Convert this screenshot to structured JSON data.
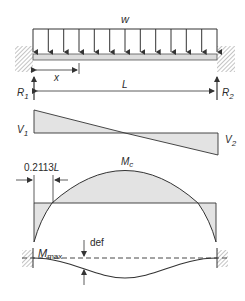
{
  "diagram": {
    "load": {
      "label": "w",
      "arrow_count": 13
    },
    "dimensions": {
      "x_label": "x",
      "span_label": "L",
      "inflection_label_prefix": "0.2113",
      "inflection_label_suffix": "L"
    },
    "reactions": {
      "left": {
        "main": "R",
        "sub": "1"
      },
      "right": {
        "main": "R",
        "sub": "2"
      }
    },
    "shear": {
      "left": {
        "main": "V",
        "sub": "1"
      },
      "right": {
        "main": "V",
        "sub": "2"
      }
    },
    "moment": {
      "center": {
        "main": "M",
        "sub": "c"
      },
      "end": {
        "main": "M",
        "sub": "max"
      }
    },
    "deflection": {
      "label": "def"
    },
    "colors": {
      "line": "#333333",
      "fill": "#e3e3e3",
      "beam_fill": "#dcdcdc",
      "hatch": "#8a8a8a"
    }
  }
}
